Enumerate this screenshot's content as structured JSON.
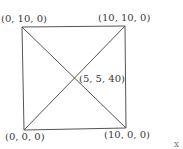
{
  "diagram": {
    "type": "pyramid-top-view",
    "vertices": {
      "top_left": {
        "label": "(0, 10, 0)",
        "x": 0,
        "y": 10,
        "z": 0
      },
      "top_right": {
        "label": "(10, 10, 0)",
        "x": 10,
        "y": 10,
        "z": 0
      },
      "bottom_left": {
        "label": "(0, 0, 0)",
        "x": 0,
        "y": 0,
        "z": 0
      },
      "bottom_right": {
        "label": "(10, 0, 0)",
        "x": 10,
        "y": 0,
        "z": 0
      },
      "apex": {
        "label": "(5, 5, 40)",
        "x": 5,
        "y": 5,
        "z": 40
      }
    },
    "partial_axis_label": "x"
  }
}
